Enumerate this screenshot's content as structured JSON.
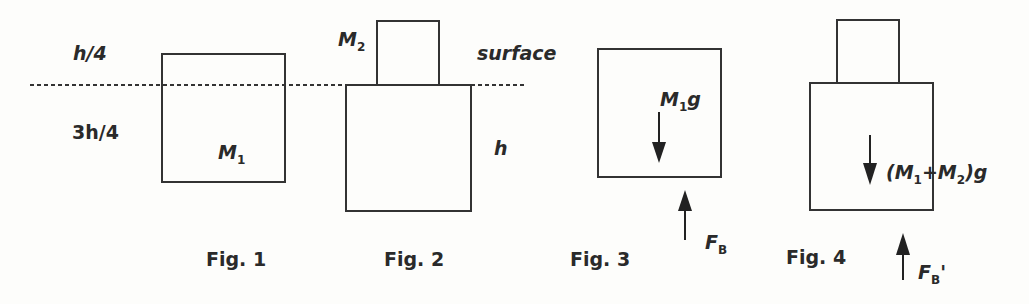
{
  "figures": [
    {
      "caption": "Fig. 1",
      "labels": {
        "top": "h/4",
        "bottom": "3h/4",
        "mass": "M",
        "mass_sub": "1"
      }
    },
    {
      "caption": "Fig. 2",
      "labels": {
        "mass": "M",
        "mass_sub": "2",
        "surface": "surface",
        "height": "h"
      }
    },
    {
      "caption": "Fig. 3",
      "labels": {
        "weight": "M",
        "weight_sub": "1",
        "weight_tail": "g",
        "buoyant": "F",
        "buoyant_sub": "B"
      }
    },
    {
      "caption": "Fig. 4",
      "labels": {
        "weight_open": "(M",
        "weight_sub1": "1",
        "weight_plus": "+M",
        "weight_sub2": "2",
        "weight_tail": ")g",
        "buoyant": "F",
        "buoyant_sub": "B",
        "buoyant_prime": "'"
      }
    }
  ]
}
